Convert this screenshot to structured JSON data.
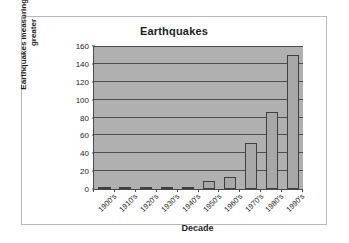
{
  "chart_data": {
    "type": "bar",
    "title": "Earthquakes",
    "xlabel": "Decade",
    "ylabel": "Earthquakes measuring 6.0 or greater",
    "ylabel_line1": "Earthquakes measuring 6.0 or",
    "ylabel_line2": "greater",
    "categories": [
      "1900's",
      "1910's",
      "1920's",
      "1930's",
      "1940's",
      "1950's",
      "1960's",
      "1970's",
      "1980's",
      "1990's"
    ],
    "values": [
      2,
      2,
      2,
      2,
      2,
      9,
      13,
      51,
      86,
      150
    ],
    "ylim": [
      0,
      160
    ],
    "ytick_step": 20,
    "yticks": [
      "160",
      "140",
      "120",
      "100",
      "80",
      "60",
      "40",
      "20",
      "0"
    ],
    "grid": true,
    "legend": "none",
    "series": [
      {
        "name": "Earthquakes measuring 6.0 or greater",
        "values": [
          2,
          2,
          2,
          2,
          2,
          9,
          13,
          51,
          86,
          150
        ]
      }
    ],
    "colors": {
      "plot_background": "#b0b0b0",
      "bar_fill": "#a8a8a8",
      "bar_border": "#3f3f3f",
      "gridline": "#4d4d4d",
      "axis": "#4a4a4a",
      "text": "#1c1c1c",
      "frame_border": "#b9b9b9",
      "page_background": "#ffffff"
    }
  }
}
